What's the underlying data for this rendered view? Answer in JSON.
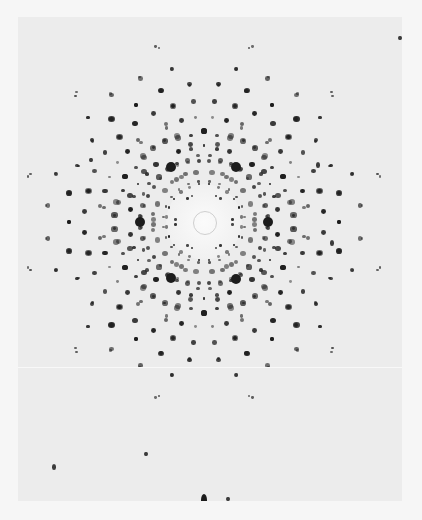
{
  "image": {
    "subject": "X-ray diffraction pattern (Laue photograph)",
    "colors": {
      "background": "#f6f6f6",
      "film": "#ececec",
      "spot": "#1c1c1c"
    },
    "center": [
      186,
      205
    ],
    "beamstop_radius": 11,
    "halo_radius": 38,
    "symmetry": 6,
    "major_spots": [
      {
        "x": 153,
        "y": 150,
        "r": 5
      },
      {
        "x": 218,
        "y": 150,
        "r": 5
      },
      {
        "x": 122,
        "y": 205,
        "r": 5
      },
      {
        "x": 250,
        "y": 205,
        "r": 5
      },
      {
        "x": 153,
        "y": 261,
        "r": 5
      },
      {
        "x": 218,
        "y": 262,
        "r": 5
      },
      {
        "x": 186,
        "y": 483,
        "rx": 3,
        "ry": 6
      }
    ],
    "rings": [
      {
        "radius": 28,
        "count": 18,
        "size": 1.6,
        "offset": 5
      },
      {
        "radius": 40,
        "count": 24,
        "size": 2.0,
        "offset": 0
      },
      {
        "radius": 52,
        "count": 30,
        "size": 2.2,
        "offset": 3
      },
      {
        "radius": 64,
        "count": 36,
        "size": 2.4,
        "offset": 0
      },
      {
        "radius": 76,
        "count": 36,
        "size": 2.4,
        "offset": 5
      },
      {
        "radius": 90,
        "count": 42,
        "size": 2.6,
        "offset": 0
      },
      {
        "radius": 104,
        "count": 42,
        "size": 2.4,
        "offset": 4
      },
      {
        "radius": 120,
        "count": 36,
        "size": 2.6,
        "offset": 0
      },
      {
        "radius": 138,
        "count": 30,
        "size": 2.5,
        "offset": 6
      },
      {
        "radius": 158,
        "count": 30,
        "size": 2.0,
        "offset": 0
      },
      {
        "radius": 180,
        "count": 24,
        "size": 1.8,
        "offset": 7
      }
    ],
    "outer_spots": [
      {
        "x": 36,
        "y": 450,
        "r": 2
      },
      {
        "x": 128,
        "y": 437,
        "r": 1.6
      },
      {
        "x": 210,
        "y": 482,
        "r": 1.6
      },
      {
        "x": 245,
        "y": 494,
        "r": 1.6
      },
      {
        "x": 344,
        "y": 488,
        "r": 2
      },
      {
        "x": 73,
        "y": 143,
        "r": 1.6
      },
      {
        "x": 382,
        "y": 21,
        "r": 1.4
      },
      {
        "x": 300,
        "y": 148,
        "r": 1.8
      },
      {
        "x": 314,
        "y": 226,
        "r": 1.8
      }
    ]
  }
}
